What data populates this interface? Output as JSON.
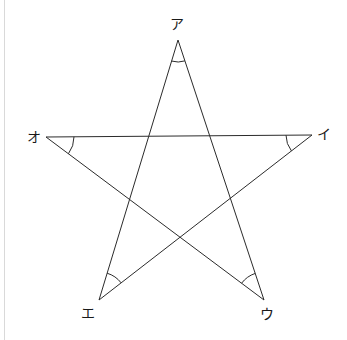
{
  "figure": {
    "background_color": "#ffffff",
    "stroke_color": "#2b2b2b",
    "rule_color": "#d9d9d9",
    "label_color": "#1a1a1a",
    "width": 347,
    "height": 340
  },
  "vertices": [
    {
      "id": "a",
      "label": "ア",
      "x": 178,
      "y": 40,
      "label_x": 177,
      "label_y": 24
    },
    {
      "id": "i",
      "label": "イ",
      "x": 312,
      "y": 135,
      "label_x": 324,
      "label_y": 134
    },
    {
      "id": "u",
      "label": "ウ",
      "x": 264,
      "y": 300,
      "label_x": 267,
      "label_y": 314
    },
    {
      "id": "e",
      "label": "エ",
      "x": 99,
      "y": 300,
      "label_x": 88,
      "label_y": 313
    },
    {
      "id": "o",
      "label": "オ",
      "x": 46,
      "y": 137,
      "label_x": 34,
      "label_y": 137
    }
  ],
  "edges": [
    {
      "from": "a",
      "to": "u",
      "name": "edge-a-u"
    },
    {
      "from": "u",
      "to": "o",
      "name": "edge-u-o"
    },
    {
      "from": "o",
      "to": "i",
      "name": "edge-o-i"
    },
    {
      "from": "i",
      "to": "e",
      "name": "edge-i-e"
    },
    {
      "from": "e",
      "to": "a",
      "name": "edge-e-a"
    }
  ],
  "angle_arcs": [
    {
      "at": "a",
      "radius": 22,
      "name": "angle-arc-a"
    },
    {
      "at": "i",
      "radius": 26,
      "name": "angle-arc-i"
    },
    {
      "at": "u",
      "radius": 28,
      "name": "angle-arc-u"
    },
    {
      "at": "e",
      "radius": 28,
      "name": "angle-arc-e"
    },
    {
      "at": "o",
      "radius": 28,
      "name": "angle-arc-o"
    }
  ]
}
